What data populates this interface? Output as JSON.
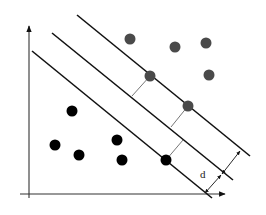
{
  "diagram": {
    "margin_label": "d",
    "colors": {
      "line": "#111111",
      "class_a": "#4a4a4a",
      "class_b": "#000000",
      "connector": "#555555"
    },
    "axes": {
      "y_axis": {
        "x1": 29,
        "y1": 198,
        "x2": 29,
        "y2": 25
      },
      "x_axis": {
        "x1": 20,
        "y1": 194,
        "x2": 225,
        "y2": 194
      }
    },
    "hyperplanes": [
      {
        "name": "lower-margin",
        "x1": 32,
        "y1": 51,
        "x2": 212,
        "y2": 198
      },
      {
        "name": "decision-boundary",
        "x1": 52,
        "y1": 33,
        "x2": 233,
        "y2": 180
      },
      {
        "name": "upper-margin",
        "x1": 77,
        "y1": 15,
        "x2": 250,
        "y2": 156
      }
    ],
    "class_a_points": [
      {
        "x": 130,
        "y": 39
      },
      {
        "x": 175,
        "y": 47
      },
      {
        "x": 206,
        "y": 43
      },
      {
        "x": 209,
        "y": 75
      },
      {
        "x": 150,
        "y": 76
      },
      {
        "x": 188,
        "y": 106
      }
    ],
    "class_b_points": [
      {
        "x": 72,
        "y": 111
      },
      {
        "x": 55,
        "y": 145
      },
      {
        "x": 79,
        "y": 155
      },
      {
        "x": 117,
        "y": 140
      },
      {
        "x": 122,
        "y": 160
      },
      {
        "x": 166,
        "y": 160
      }
    ]
  }
}
